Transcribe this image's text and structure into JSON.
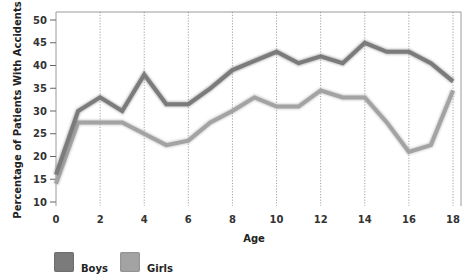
{
  "chart_data": {
    "type": "line",
    "title": "",
    "xlabel": "Age",
    "ylabel": "Percentage of Patients With Accidents",
    "x": [
      0,
      1,
      2,
      3,
      4,
      5,
      6,
      7,
      8,
      9,
      10,
      11,
      12,
      13,
      14,
      15,
      16,
      17,
      18
    ],
    "x_ticks": [
      0,
      2,
      4,
      6,
      8,
      10,
      12,
      14,
      16,
      18
    ],
    "y_ticks": [
      10,
      15,
      20,
      25,
      30,
      35,
      40,
      45,
      50
    ],
    "xlim": [
      0,
      18
    ],
    "ylim": [
      10,
      50
    ],
    "grid": "vertical dotted at even ages",
    "legend_position": "bottom-left",
    "series": [
      {
        "name": "Boys",
        "color": "#7b7b7b",
        "values": [
          16,
          30,
          33,
          30,
          38,
          31.5,
          31.5,
          35,
          39,
          41,
          43,
          40.5,
          42,
          40.5,
          45,
          43,
          43,
          40.5,
          36.5
        ]
      },
      {
        "name": "Girls",
        "color": "#a3a3a3",
        "values": [
          14,
          27.5,
          27.5,
          27.5,
          25,
          22.5,
          23.5,
          27.5,
          30,
          33,
          31,
          31,
          34.5,
          33,
          33,
          27.5,
          21,
          22.5,
          34.5
        ]
      }
    ]
  },
  "legend": {
    "items": [
      {
        "label": "Boys",
        "color": "#7b7b7b"
      },
      {
        "label": "Girls",
        "color": "#a3a3a3"
      }
    ]
  },
  "colors": {
    "frame": "#9a9a9a",
    "gridline": "#8a8a8a",
    "tick_text": "#333333"
  }
}
